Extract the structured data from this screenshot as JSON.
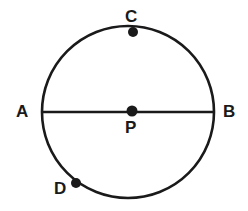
{
  "figure": {
    "background_color": "#ffffff",
    "stroke_color": "#1a1a1a",
    "label_color": "#1a1a1a",
    "stroke_width": 2.6,
    "circle": {
      "center_x": 128,
      "center_y": 112,
      "radius": 86
    },
    "diameter": {
      "name": "AB",
      "x1": 42,
      "y1": 112,
      "x2": 214,
      "y2": 112
    },
    "points": [
      {
        "id": "A",
        "label": "A",
        "x": 42,
        "y": 112,
        "marker": false
      },
      {
        "id": "B",
        "label": "B",
        "x": 214,
        "y": 112,
        "marker": false
      },
      {
        "id": "C",
        "label": "C",
        "x": 133,
        "y": 32,
        "marker": true,
        "marker_radius": 5
      },
      {
        "id": "D",
        "label": "D",
        "x": 76,
        "y": 183,
        "marker": true,
        "marker_radius": 5
      },
      {
        "id": "P",
        "label": "P",
        "x": 132,
        "y": 111,
        "marker": true,
        "marker_radius": 5.5
      }
    ]
  }
}
